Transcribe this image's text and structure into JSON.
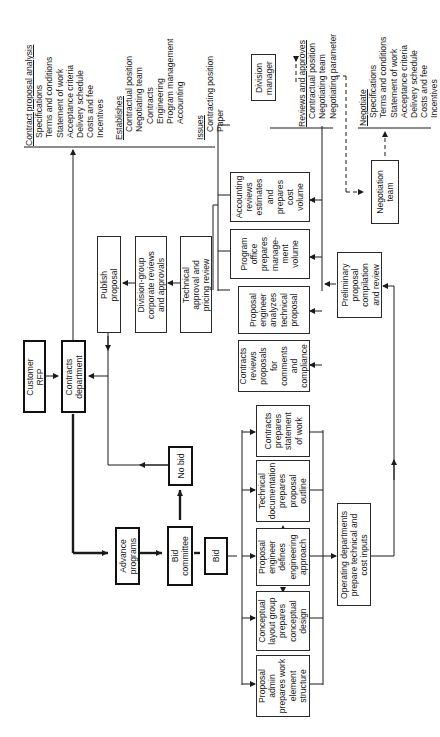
{
  "diagram": {
    "orientation": "rotated-90-ccw",
    "nodes": {
      "customer_rfp": [
        "Customer",
        "RFP"
      ],
      "contracts_department": [
        "Contracts",
        "department"
      ],
      "advance_programs": [
        "Advance",
        "programs"
      ],
      "bid_committee": [
        "Bid",
        "committee"
      ],
      "no_bid": [
        "No bid"
      ],
      "bid": [
        "Bid"
      ],
      "proposal_admin": [
        "Proposal",
        "admin",
        "prepares work",
        "element",
        "structure"
      ],
      "conceptual_layout": [
        "Conceptual",
        "layout group",
        "prepares",
        "conceptual",
        "design"
      ],
      "proposal_engineer_defines": [
        "Proposal",
        "engineer",
        "defines",
        "engineering",
        "approach"
      ],
      "technical_documentation": [
        "Technical",
        "documentation",
        "prepares",
        "proposal",
        "outline"
      ],
      "contracts_sow": [
        "Contracts",
        "prepares",
        "statement",
        "of work"
      ],
      "operating_departments": [
        "Operating departments",
        "prepare technical and",
        "cost inputs"
      ],
      "preliminary_compilation": [
        "Preliminary",
        "proposal",
        "compilation",
        "and review"
      ],
      "contracts_reviews": [
        "Contracts",
        "reviews",
        "proposals",
        "for",
        "comments",
        "and",
        "compliance"
      ],
      "proposal_engineer_analyzes": [
        "Proposal",
        "engineer",
        "analyzes",
        "technical",
        "proposal"
      ],
      "program_office": [
        "Program",
        "office",
        "prepares",
        "manage-",
        "ment",
        "volume"
      ],
      "accounting_reviews": [
        "Accounting",
        "reviews",
        "estimates",
        "and",
        "prepares",
        "cost",
        "volume"
      ],
      "technical_approval": [
        "Technical",
        "approval and",
        "pricing review"
      ],
      "division_group": [
        "Division-group",
        "corporate reviews",
        "and approvals"
      ],
      "publish_proposal": [
        "Publish",
        "proposal"
      ],
      "division_manager": [
        "Division",
        "manager"
      ],
      "negotiation_team": [
        "Negotiation",
        "team"
      ]
    },
    "notes": {
      "contract_analysis": {
        "heading": "Contract proposal analysis",
        "items": [
          "Specifications",
          "Terms and conditions",
          "Statement of work",
          "Acceptance criteria",
          "Delivery schedule",
          "Costs and fee",
          "Incentives"
        ]
      },
      "establishes": {
        "heading": "Establishes",
        "items": [
          "Contractual position",
          "Negotiating team"
        ],
        "subitems": [
          "Contracts",
          "Engineering",
          "Program management",
          "Accounting"
        ]
      },
      "issues": {
        "heading": "Issues",
        "items": [
          "Contracting position",
          "Paper"
        ]
      },
      "reviews_approves": {
        "heading": "Reviews and approves",
        "items": [
          "Contractual position",
          "Negotiating team",
          "Negotiating parameter"
        ]
      },
      "negotiate": {
        "heading": "Negotiate",
        "items": [
          "Specifications",
          "Terms and conditions",
          "Statement of work",
          "Acceptance criteria",
          "Delivery schedule",
          "Costs and fee",
          "Incentives"
        ]
      }
    },
    "colors": {
      "line": "#1a1a1a",
      "background": "#ffffff"
    }
  }
}
